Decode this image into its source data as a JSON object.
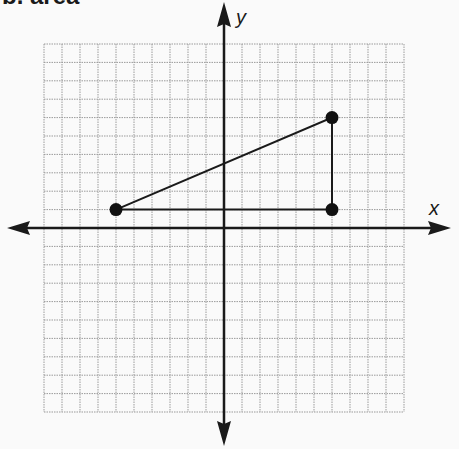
{
  "heading": "b. area",
  "graph": {
    "x_axis_label": "x",
    "y_axis_label": "y",
    "grid": {
      "columns": 20,
      "rows": 20,
      "x_range": [
        -10,
        10
      ],
      "y_range": [
        -10,
        10
      ],
      "line_color": "#9a9a9a",
      "style": "dotted"
    },
    "axis_color": "#1a1a1a",
    "triangle": {
      "vertices": [
        {
          "x": -6,
          "y": 1
        },
        {
          "x": 6,
          "y": 1
        },
        {
          "x": 6,
          "y": 6
        }
      ],
      "stroke": "#1a1a1a",
      "point_color": "#111111"
    }
  }
}
